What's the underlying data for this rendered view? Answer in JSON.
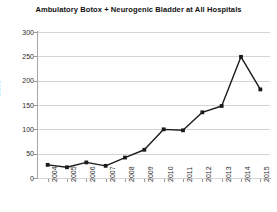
{
  "chart_data": {
    "type": "line",
    "title": "Ambulatory Botox + Neurogenic Bladder at All Hospitals",
    "xlabel": "",
    "ylabel": "# cases",
    "categories": [
      "2004",
      "2005",
      "2006",
      "2007",
      "2008",
      "2009",
      "2010",
      "2011",
      "2012",
      "2013",
      "2014",
      "2015"
    ],
    "values": [
      27,
      22,
      32,
      25,
      42,
      58,
      100,
      98,
      135,
      148,
      249,
      182
    ],
    "ylim": [
      0,
      300
    ],
    "yticks": [
      0,
      50,
      100,
      150,
      200,
      250,
      300
    ],
    "ytick_labels": [
      "0",
      "50",
      "100",
      "150",
      "200",
      "250",
      "300"
    ],
    "grid": true,
    "legend": false,
    "series_name": "Ambulatory Botox + Neurogenic Bladder",
    "marker": "square",
    "line_color": "#1b1b1b",
    "grid_color": "#d4d4d4",
    "background_color": "#ffffff"
  }
}
